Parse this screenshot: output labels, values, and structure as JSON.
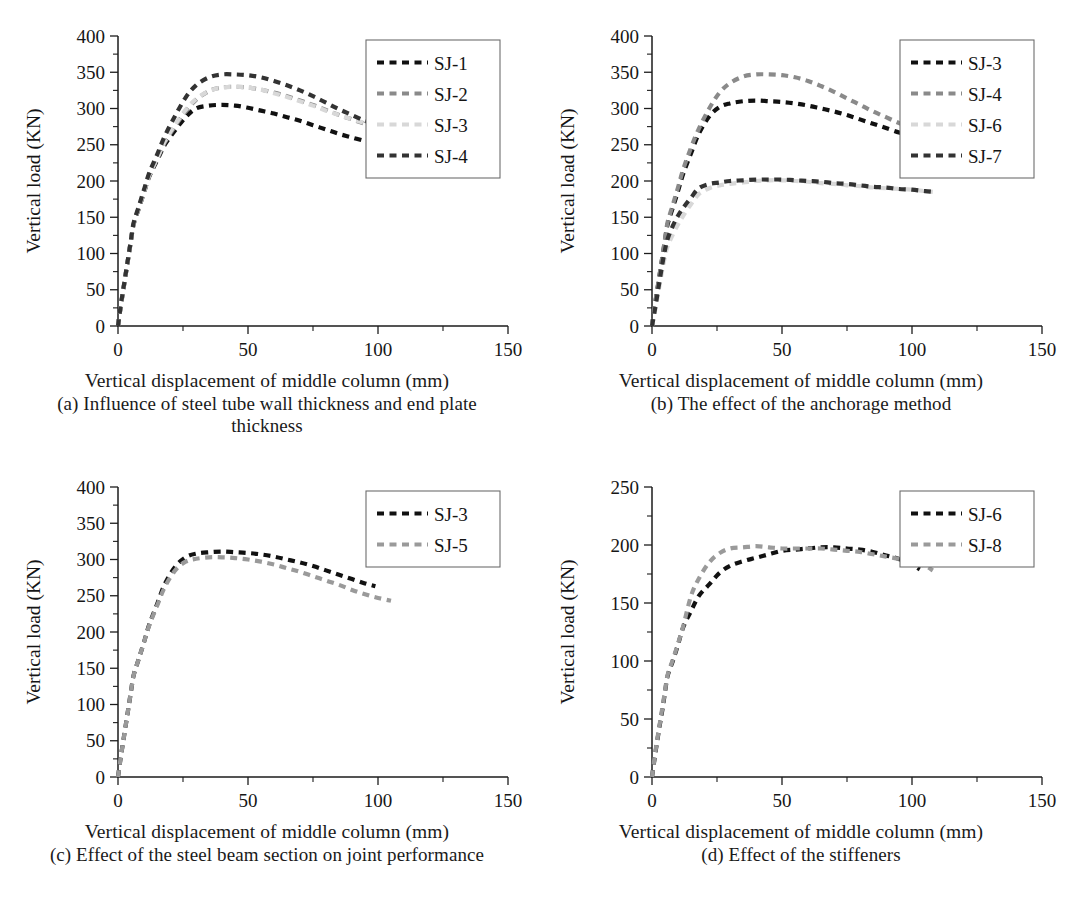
{
  "figure": {
    "axis_x_title": "Vertical displacement of middle column (mm)",
    "axis_y_title": "Vertical load (KN)",
    "panels": [
      {
        "key": "a",
        "caption": "(a) Influence of steel tube wall thickness and end plate thickness"
      },
      {
        "key": "b",
        "caption": "(b) The effect of the anchorage method"
      },
      {
        "key": "c",
        "caption": "(c) Effect of the steel beam section on joint performance"
      },
      {
        "key": "d",
        "caption": "(d) Effect of the stiffeners"
      }
    ]
  },
  "chart_data": [
    {
      "panel": "a",
      "type": "line",
      "title": "(a) Influence of steel tube wall thickness and end plate thickness",
      "xlabel": "Vertical displacement of middle column (mm)",
      "ylabel": "Vertical load (KN)",
      "xlim": [
        0,
        150
      ],
      "ylim": [
        0,
        400
      ],
      "xticks": [
        0,
        50,
        100,
        150
      ],
      "yticks": [
        0,
        50,
        100,
        150,
        200,
        250,
        300,
        350,
        400
      ],
      "xminor_step": 25,
      "yminor_step": 25,
      "grid": false,
      "legend_position": "top-right",
      "series": [
        {
          "name": "SJ-1",
          "color": "#111111",
          "x": [
            0,
            1,
            2,
            3,
            4,
            5,
            6,
            8,
            10,
            12,
            15,
            18,
            22,
            26,
            30,
            35,
            40,
            45,
            50,
            55,
            60,
            65,
            70,
            75,
            80,
            85,
            90,
            95,
            98
          ],
          "y": [
            0,
            26,
            49,
            72,
            95,
            118,
            140,
            162,
            184,
            206,
            228,
            250,
            270,
            288,
            300,
            304,
            305,
            304,
            301,
            297,
            293,
            288,
            283,
            277,
            271,
            265,
            260,
            255,
            252
          ]
        },
        {
          "name": "SJ-2",
          "color": "#8a8a8a",
          "x": [
            0,
            1,
            2,
            3,
            4,
            5,
            6,
            8,
            10,
            12,
            15,
            18,
            22,
            26,
            30,
            35,
            40,
            45,
            50,
            55,
            60,
            65,
            70,
            75,
            80,
            85,
            90,
            95,
            99
          ],
          "y": [
            0,
            26,
            49,
            72,
            95,
            118,
            140,
            163,
            185,
            207,
            230,
            253,
            276,
            296,
            312,
            324,
            329,
            330,
            329,
            326,
            322,
            317,
            311,
            305,
            298,
            291,
            285,
            279,
            275
          ]
        },
        {
          "name": "SJ-3",
          "color": "#d8d8d8",
          "x": [
            0,
            1,
            2,
            3,
            4,
            5,
            6,
            8,
            10,
            12,
            15,
            18,
            22,
            26,
            30,
            35,
            40,
            45,
            50,
            55,
            60,
            65,
            70,
            75,
            80,
            85,
            90,
            95,
            99
          ],
          "y": [
            0,
            26,
            49,
            72,
            95,
            118,
            140,
            163,
            185,
            208,
            231,
            255,
            278,
            298,
            313,
            324,
            329,
            330,
            329,
            326,
            321,
            316,
            310,
            304,
            297,
            291,
            285,
            280,
            276
          ]
        },
        {
          "name": "SJ-4",
          "color": "#333333",
          "x": [
            0,
            1,
            2,
            3,
            4,
            5,
            6,
            8,
            10,
            12,
            15,
            18,
            22,
            26,
            30,
            35,
            40,
            45,
            50,
            55,
            60,
            65,
            70,
            75,
            80,
            85,
            90,
            95,
            99
          ],
          "y": [
            0,
            27,
            50,
            73,
            96,
            119,
            142,
            165,
            188,
            211,
            236,
            262,
            290,
            315,
            332,
            343,
            347,
            347,
            346,
            343,
            338,
            332,
            325,
            317,
            308,
            299,
            291,
            283,
            278
          ]
        }
      ]
    },
    {
      "panel": "b",
      "type": "line",
      "title": "(b) The effect of the anchorage method",
      "xlabel": "Vertical displacement of middle column (mm)",
      "ylabel": "Vertical load (KN)",
      "xlim": [
        0,
        150
      ],
      "ylim": [
        0,
        400
      ],
      "xticks": [
        0,
        50,
        100,
        150
      ],
      "yticks": [
        0,
        50,
        100,
        150,
        200,
        250,
        300,
        350,
        400
      ],
      "xminor_step": 25,
      "yminor_step": 25,
      "grid": false,
      "legend_position": "top-right",
      "series": [
        {
          "name": "SJ-3",
          "color": "#111111",
          "x": [
            0,
            1,
            2,
            3,
            4,
            5,
            6,
            8,
            10,
            12,
            15,
            18,
            22,
            26,
            30,
            35,
            40,
            45,
            50,
            55,
            60,
            65,
            70,
            75,
            80,
            85,
            90,
            95,
            98
          ],
          "y": [
            0,
            26,
            49,
            72,
            95,
            118,
            140,
            163,
            186,
            210,
            238,
            265,
            289,
            302,
            307,
            310,
            311,
            310,
            309,
            307,
            304,
            300,
            296,
            291,
            285,
            279,
            273,
            267,
            264
          ]
        },
        {
          "name": "SJ-4",
          "color": "#8a8a8a",
          "x": [
            0,
            1,
            2,
            3,
            4,
            5,
            6,
            8,
            10,
            12,
            15,
            18,
            22,
            26,
            30,
            35,
            40,
            45,
            50,
            55,
            60,
            65,
            70,
            75,
            80,
            85,
            90,
            95,
            99
          ],
          "y": [
            0,
            27,
            50,
            73,
            96,
            120,
            143,
            167,
            191,
            216,
            246,
            272,
            300,
            322,
            335,
            344,
            347,
            347,
            346,
            343,
            338,
            331,
            323,
            314,
            305,
            296,
            288,
            280,
            275
          ]
        },
        {
          "name": "SJ-6",
          "color": "#d8d8d8",
          "x": [
            0,
            1,
            2,
            3,
            4,
            5,
            6,
            8,
            10,
            12,
            15,
            18,
            22,
            26,
            30,
            35,
            40,
            45,
            50,
            55,
            60,
            65,
            70,
            75,
            80,
            85,
            90,
            95,
            100,
            105,
            108
          ],
          "y": [
            0,
            18,
            38,
            58,
            78,
            96,
            110,
            126,
            140,
            152,
            168,
            182,
            190,
            194,
            196,
            198,
            200,
            201,
            201,
            200,
            199,
            197,
            196,
            194,
            193,
            191,
            190,
            189,
            188,
            186,
            185
          ]
        },
        {
          "name": "SJ-7",
          "color": "#333333",
          "x": [
            0,
            1,
            2,
            3,
            4,
            5,
            6,
            8,
            10,
            12,
            15,
            18,
            22,
            26,
            30,
            35,
            40,
            45,
            50,
            55,
            60,
            65,
            70,
            75,
            80,
            85,
            90,
            95,
            100,
            105,
            108
          ],
          "y": [
            0,
            20,
            42,
            64,
            86,
            105,
            120,
            138,
            152,
            163,
            177,
            190,
            196,
            198,
            200,
            201,
            202,
            202,
            202,
            201,
            200,
            199,
            197,
            196,
            194,
            192,
            191,
            189,
            188,
            186,
            185
          ]
        }
      ]
    },
    {
      "panel": "c",
      "type": "line",
      "title": "(c) Effect of the steel beam section on joint performance",
      "xlabel": "Vertical displacement of middle column (mm)",
      "ylabel": "Vertical load (KN)",
      "xlim": [
        0,
        150
      ],
      "ylim": [
        0,
        400
      ],
      "xticks": [
        0,
        50,
        100,
        150
      ],
      "yticks": [
        0,
        50,
        100,
        150,
        200,
        250,
        300,
        350,
        400
      ],
      "xminor_step": 25,
      "yminor_step": 25,
      "grid": false,
      "legend_position": "top-right",
      "series": [
        {
          "name": "SJ-3",
          "color": "#111111",
          "x": [
            0,
            1,
            2,
            3,
            4,
            5,
            6,
            8,
            10,
            12,
            15,
            18,
            22,
            26,
            30,
            35,
            40,
            45,
            50,
            55,
            60,
            65,
            70,
            75,
            80,
            85,
            90,
            95,
            99
          ],
          "y": [
            0,
            26,
            49,
            72,
            95,
            118,
            140,
            163,
            186,
            210,
            238,
            266,
            290,
            303,
            308,
            310,
            311,
            310,
            309,
            307,
            304,
            300,
            296,
            291,
            285,
            279,
            273,
            267,
            263
          ]
        },
        {
          "name": "SJ-5",
          "color": "#9a9a9a",
          "x": [
            0,
            1,
            2,
            3,
            4,
            5,
            6,
            8,
            10,
            12,
            15,
            18,
            22,
            26,
            30,
            35,
            40,
            45,
            50,
            55,
            60,
            65,
            70,
            75,
            80,
            85,
            90,
            95,
            100,
            105
          ],
          "y": [
            0,
            26,
            49,
            72,
            95,
            118,
            140,
            163,
            186,
            209,
            236,
            262,
            285,
            297,
            301,
            303,
            303,
            302,
            300,
            297,
            293,
            288,
            283,
            277,
            271,
            265,
            258,
            252,
            247,
            243
          ]
        }
      ]
    },
    {
      "panel": "d",
      "type": "line",
      "title": "(d) Effect of the stiffeners",
      "xlabel": "Vertical displacement of middle column (mm)",
      "ylabel": "Vertical load (KN)",
      "xlim": [
        0,
        150
      ],
      "ylim": [
        0,
        250
      ],
      "xticks": [
        0,
        50,
        100,
        150
      ],
      "yticks": [
        0,
        50,
        100,
        150,
        200,
        250
      ],
      "xminor_step": 25,
      "yminor_step": 25,
      "grid": false,
      "legend_position": "top-right",
      "series": [
        {
          "name": "SJ-6",
          "color": "#111111",
          "x": [
            0,
            1,
            2,
            3,
            4,
            5,
            6,
            8,
            10,
            12,
            15,
            18,
            22,
            26,
            30,
            35,
            40,
            45,
            50,
            55,
            60,
            65,
            70,
            75,
            80,
            85,
            90,
            95,
            100,
            103
          ],
          "y": [
            0,
            16,
            31,
            45,
            58,
            73,
            87,
            100,
            114,
            129,
            143,
            156,
            166,
            176,
            182,
            186,
            189,
            192,
            195,
            196,
            197,
            198,
            198,
            197,
            196,
            194,
            191,
            188,
            183,
            179
          ]
        },
        {
          "name": "SJ-8",
          "color": "#9a9a9a",
          "x": [
            0,
            1,
            2,
            3,
            4,
            5,
            6,
            8,
            10,
            12,
            15,
            18,
            22,
            26,
            30,
            35,
            40,
            45,
            50,
            55,
            60,
            65,
            70,
            75,
            80,
            85,
            90,
            95,
            100,
            105,
            108
          ],
          "y": [
            0,
            17,
            32,
            46,
            60,
            74,
            88,
            101,
            115,
            130,
            156,
            171,
            185,
            193,
            197,
            198,
            199,
            198,
            197,
            197,
            197,
            197,
            196,
            195,
            194,
            192,
            190,
            188,
            185,
            182,
            178
          ]
        }
      ]
    }
  ]
}
